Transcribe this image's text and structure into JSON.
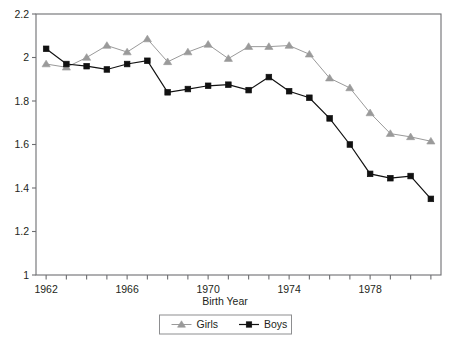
{
  "chart_data": {
    "type": "line",
    "title": "",
    "xlabel": "Birth Year",
    "ylabel": "",
    "xlim": [
      1961.5,
      1981.5
    ],
    "ylim": [
      1.0,
      2.2
    ],
    "grid": false,
    "legend_position": "bottom",
    "x_tick_labels": [
      "1962",
      "1966",
      "1970",
      "1974",
      "1978"
    ],
    "x_tick_values": [
      1962,
      1966,
      1970,
      1974,
      1978
    ],
    "x_minor_ticks": [
      1962,
      1963,
      1964,
      1965,
      1966,
      1967,
      1968,
      1969,
      1970,
      1971,
      1972,
      1973,
      1974,
      1975,
      1976,
      1977,
      1978,
      1979,
      1980,
      1981
    ],
    "y_tick_labels": [
      "1",
      "1.2",
      "1.4",
      "1.6",
      "1.8",
      "2",
      "2.2"
    ],
    "y_tick_values": [
      1,
      1.2,
      1.4,
      1.6,
      1.8,
      2,
      2.2
    ],
    "x": [
      1962,
      1963,
      1964,
      1965,
      1966,
      1967,
      1968,
      1969,
      1970,
      1971,
      1972,
      1973,
      1974,
      1975,
      1976,
      1977,
      1978,
      1979,
      1980,
      1981
    ],
    "series": [
      {
        "name": "Girls",
        "marker": "triangle",
        "color": "#9a9a9a",
        "values": [
          1.97,
          1.955,
          2.0,
          2.055,
          2.025,
          2.085,
          1.98,
          2.025,
          2.06,
          1.995,
          2.05,
          2.05,
          2.055,
          2.015,
          1.905,
          1.86,
          1.745,
          1.65,
          1.635,
          1.615
        ]
      },
      {
        "name": "Boys",
        "marker": "square",
        "color": "#111111",
        "values": [
          2.04,
          1.97,
          1.96,
          1.945,
          1.97,
          1.985,
          1.84,
          1.855,
          1.87,
          1.875,
          1.85,
          1.91,
          1.845,
          1.815,
          1.72,
          1.6,
          1.465,
          1.445,
          1.455,
          1.35
        ]
      }
    ]
  },
  "legend": {
    "items": [
      {
        "label": "Girls"
      },
      {
        "label": "Boys"
      }
    ]
  },
  "axis": {
    "x_title": "Birth Year"
  },
  "colors": {
    "girls": "#9a9a9a",
    "boys": "#111111",
    "frame": "#6d6e71",
    "text": "#231f20"
  }
}
